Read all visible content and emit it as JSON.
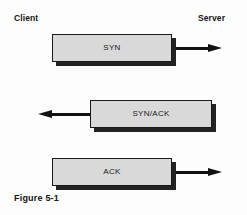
{
  "diagram": {
    "caption": "Figure 5-1",
    "background_color": "#fdfdfd",
    "endpoints": {
      "left_label": "Client",
      "right_label": "Server"
    },
    "colors": {
      "box_fill": "#d9d9d9",
      "box_border": "#1a1a1a",
      "box_shadow": "#232323",
      "arrow": "#111111",
      "text": "#151515"
    },
    "messages": [
      {
        "label": "SYN",
        "direction": "client-to-server",
        "arrow_glyph": "right-arrow-icon",
        "order": 1
      },
      {
        "label": "SYN/ACK",
        "direction": "server-to-client",
        "arrow_glyph": "left-arrow-icon",
        "order": 2
      },
      {
        "label": "ACK",
        "direction": "client-to-server",
        "arrow_glyph": "right-arrow-icon",
        "order": 3
      }
    ]
  }
}
